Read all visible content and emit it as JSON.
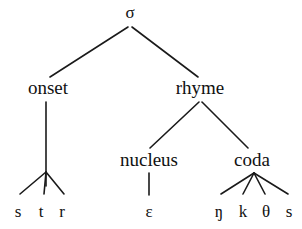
{
  "figure": {
    "background_color": "#ffffff",
    "line_color": "#1a1a1a",
    "text_color": "#111111",
    "width": 302,
    "height": 229
  },
  "nodes": {
    "root": {
      "label": "σ",
      "x": 130,
      "y": 18
    },
    "onset": {
      "label": "onset",
      "x": 48,
      "y": 94
    },
    "rhyme": {
      "label": "rhyme",
      "x": 200,
      "y": 94
    },
    "nucleus": {
      "label": "nucleus",
      "x": 149,
      "y": 166
    },
    "coda": {
      "label": "coda",
      "x": 252,
      "y": 166
    },
    "terminal_s": {
      "label": "s",
      "x": 18,
      "y": 217
    },
    "terminal_t": {
      "label": "t",
      "x": 41,
      "y": 217
    },
    "terminal_r": {
      "label": "r",
      "x": 62,
      "y": 217
    },
    "terminal_eps": {
      "label": "ɛ",
      "x": 149,
      "y": 217
    },
    "terminal_eng": {
      "label": "ŋ",
      "x": 219,
      "y": 217
    },
    "terminal_k": {
      "label": "k",
      "x": 243,
      "y": 217
    },
    "terminal_theta": {
      "label": "θ",
      "x": 266,
      "y": 217
    },
    "terminal_s2": {
      "label": "s",
      "x": 289,
      "y": 217
    }
  },
  "edges": [
    {
      "name": "edge-sigma-onset",
      "x1": 128,
      "y1": 27,
      "x2": 50,
      "y2": 77
    },
    {
      "name": "edge-sigma-rhyme",
      "x1": 132,
      "y1": 27,
      "x2": 198,
      "y2": 77
    },
    {
      "name": "edge-onset-stem",
      "x1": 46,
      "y1": 102,
      "x2": 46,
      "y2": 186
    },
    {
      "name": "edge-onset-s",
      "x1": 46,
      "y1": 172,
      "x2": 20,
      "y2": 194
    },
    {
      "name": "edge-onset-t",
      "x1": 46,
      "y1": 172,
      "x2": 44,
      "y2": 194
    },
    {
      "name": "edge-onset-r",
      "x1": 46,
      "y1": 172,
      "x2": 64,
      "y2": 194
    },
    {
      "name": "edge-rhyme-nucleus",
      "x1": 199,
      "y1": 102,
      "x2": 150,
      "y2": 148
    },
    {
      "name": "edge-rhyme-coda",
      "x1": 202,
      "y1": 102,
      "x2": 248,
      "y2": 148
    },
    {
      "name": "edge-nucleus-eps",
      "x1": 149,
      "y1": 173,
      "x2": 149,
      "y2": 195
    },
    {
      "name": "edge-coda-eng",
      "x1": 254,
      "y1": 173,
      "x2": 221,
      "y2": 194
    },
    {
      "name": "edge-coda-k",
      "x1": 254,
      "y1": 173,
      "x2": 243,
      "y2": 194
    },
    {
      "name": "edge-coda-theta",
      "x1": 254,
      "y1": 173,
      "x2": 265,
      "y2": 194
    },
    {
      "name": "edge-coda-s",
      "x1": 254,
      "y1": 173,
      "x2": 288,
      "y2": 194
    }
  ]
}
